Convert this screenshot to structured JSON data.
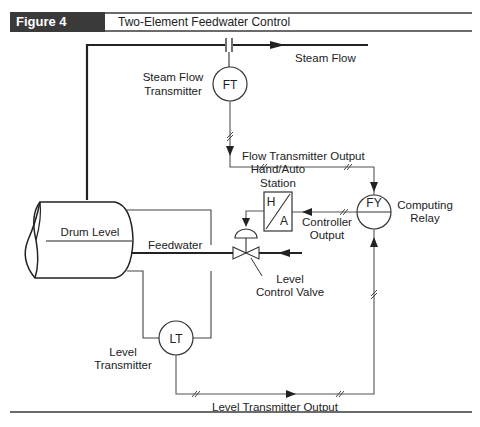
{
  "header": {
    "figure_label": "Figure 4",
    "figure_title": "Two-Element Feedwater Control"
  },
  "diagram": {
    "pipes": {
      "steam_flow": "Steam Flow",
      "feedwater": "Feedwater"
    },
    "vessel": {
      "label": "Drum Level"
    },
    "instruments": {
      "flow_transmitter": {
        "tag": "FT",
        "label_line1": "Steam Flow",
        "label_line2": "Transmitter"
      },
      "level_transmitter": {
        "tag": "LT",
        "label_line1": "Level",
        "label_line2": "Transmitter"
      },
      "computing_relay": {
        "tag": "FY",
        "label_line1": "Computing",
        "label_line2": "Relay"
      },
      "hand_auto_station": {
        "hand": "H",
        "auto": "A",
        "label_line1": "Hand/Auto",
        "label_line2": "Station"
      },
      "control_valve": {
        "label_line1": "Level",
        "label_line2": "Control Valve"
      }
    },
    "signals": {
      "flow_transmitter_output": "Flow Transmitter Output",
      "controller_output_line1": "Controller",
      "controller_output_line2": "Output",
      "level_transmitter_output": "Level Transmitter Output"
    }
  }
}
